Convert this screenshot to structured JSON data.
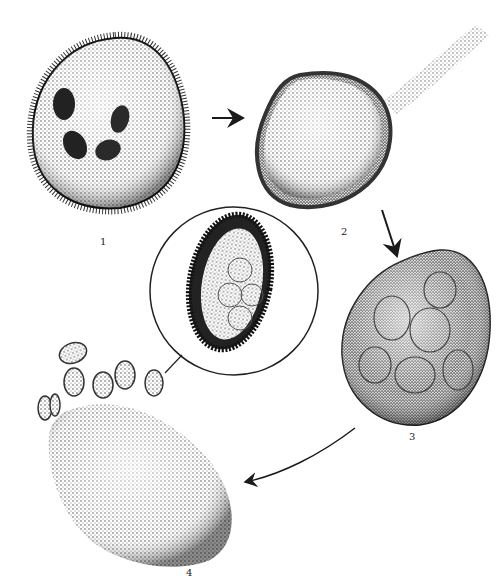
{
  "figure": {
    "stages": [
      {
        "id": "1",
        "label": "1",
        "description": "ciliated rounded cell with four dark inclusions"
      },
      {
        "id": "2",
        "label": "2",
        "description": "encysted rounded body with stalk-like tail"
      },
      {
        "id": "3",
        "label": "3",
        "description": "cyst with multiple internal rounded divisions"
      },
      {
        "id": "4",
        "label": "4",
        "description": "elongated body releasing small oval bodies"
      }
    ],
    "inset": {
      "description": "magnified ciliated oval stage inside circle"
    },
    "arrows": [
      {
        "from": "1",
        "to": "2"
      },
      {
        "from": "2",
        "to": "3"
      },
      {
        "from": "3",
        "to": "4"
      }
    ],
    "colors": {
      "ink": "#1a1a1a",
      "background": "#ffffff"
    }
  }
}
